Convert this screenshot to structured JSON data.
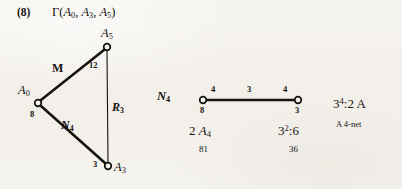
{
  "page": {
    "background_color": "#f4f2ee",
    "ink_color": "#15130f"
  },
  "header": {
    "item_number": "(8)",
    "title_gamma": "Γ(",
    "title_args": [
      "A",
      "0",
      "A",
      "3",
      "A",
      "5"
    ],
    "title_plain": "Γ(A0, A3, A5)"
  },
  "triangle_diagram": {
    "name": "amalgam-triangle",
    "vertices": [
      {
        "id": "a5",
        "label": "A",
        "sub": "5",
        "weight": "",
        "x": 107,
        "y": 47
      },
      {
        "id": "a0",
        "label": "A",
        "sub": "0",
        "weight": "8",
        "x": 38,
        "y": 103
      },
      {
        "id": "a3",
        "label": "A",
        "sub": "3",
        "weight": "3",
        "x": 108,
        "y": 166
      }
    ],
    "edges": [
      {
        "id": "a0-a5",
        "label": "M",
        "sub": "",
        "weight": "12",
        "thick": true
      },
      {
        "id": "a0-a3",
        "label": "N",
        "sub": "4",
        "weight": "",
        "thick": true
      },
      {
        "id": "a5-a3",
        "label": "R",
        "sub": "3",
        "weight": "",
        "thick": false
      }
    ],
    "vertex_label_a5": "A",
    "vertex_sub_a5": "5",
    "vertex_label_a0": "A",
    "vertex_sub_a0": "0",
    "vertex_label_a3": "A",
    "vertex_sub_a3": "3",
    "weight_a0": "8",
    "weight_a3": "3",
    "edge_label_m": "M",
    "edge_weight_12": "12",
    "edge_label_n": "N",
    "edge_sub_n": "4",
    "edge_label_r": "R",
    "edge_sub_r": "3"
  },
  "net_diagram": {
    "name": "four-net",
    "title_letter": "N",
    "title_sub": "4",
    "edge_weights": [
      "4",
      "3",
      "4"
    ],
    "vertex_weights": [
      "8",
      "3"
    ],
    "left_group_prefix": "2 ",
    "left_group_letter": "A",
    "left_group_sub": "4",
    "left_order": "81",
    "right_group_base": "3",
    "right_group_exp": "2",
    "right_group_suffix": ":6",
    "right_order": "36",
    "left_node_x": 203,
    "right_node_x": 298,
    "node_y": 100
  },
  "right_annotation": {
    "group_base": "3",
    "group_exp": "4",
    "group_suffix": ":2 A",
    "caption": "A 4-net"
  }
}
